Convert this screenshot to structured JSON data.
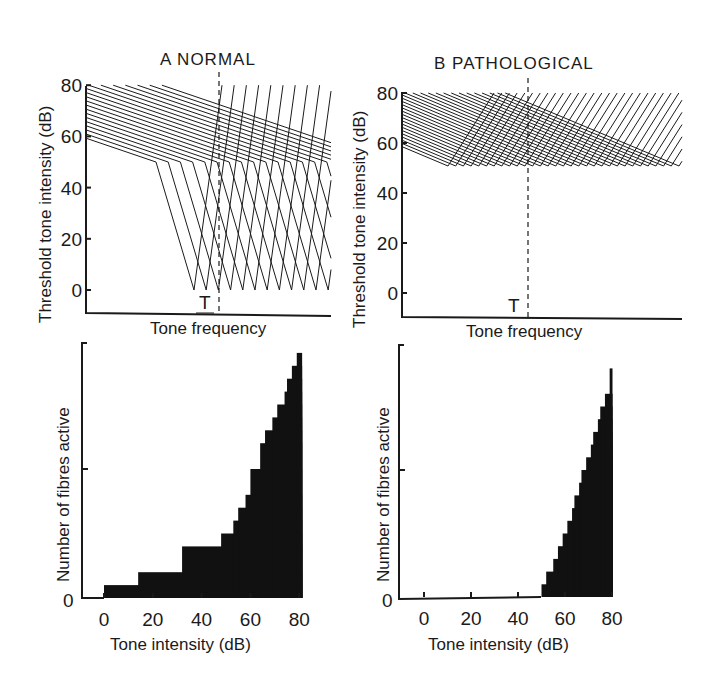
{
  "chart_data": [
    {
      "id": "A-top",
      "type": "line",
      "title": "A  NORMAL",
      "xlabel": "Tone frequency",
      "ylabel": "Threshold tone intensity (dB)",
      "yticks": [
        "0",
        "20",
        "40",
        "60",
        "80"
      ],
      "ylim": [
        -9,
        80
      ],
      "marker_label": "T",
      "description": "Family of V-shaped fibre tuning curves: sharp tips at 0 dB, low-frequency tails with knee near 50 dB",
      "curves": {
        "tip_db": 0,
        "knee_db": 50,
        "max_db": 80,
        "count_visible_tips": 12
      },
      "grid": false
    },
    {
      "id": "B-top",
      "type": "line",
      "title": "B  PATHOLOGICAL",
      "xlabel": "Tone frequency",
      "ylabel": "Threshold tone intensity (dB)",
      "yticks": [
        "0",
        "20",
        "40",
        "60",
        "80"
      ],
      "ylim": [
        -9,
        80
      ],
      "marker_label": "T",
      "description": "Family of broad tuning curves with tips elevated to ~50 dB",
      "curves": {
        "tip_db": 50,
        "max_db": 80,
        "count_visible_tips": 30
      },
      "grid": false
    },
    {
      "id": "A-bottom",
      "type": "bar",
      "xlabel": "Tone intensity (dB)",
      "ylabel": "Number of fibres active",
      "xticks": [
        "0",
        "20",
        "40",
        "60",
        "80"
      ],
      "xlim": [
        -9,
        82
      ],
      "yticks": [
        "0"
      ],
      "ylim": [
        0,
        20
      ],
      "steps": [
        {
          "x": 0,
          "y": 1
        },
        {
          "x": 14,
          "y": 2
        },
        {
          "x": 32,
          "y": 4
        },
        {
          "x": 48,
          "y": 5
        },
        {
          "x": 53,
          "y": 6
        },
        {
          "x": 55,
          "y": 7
        },
        {
          "x": 58,
          "y": 8
        },
        {
          "x": 60,
          "y": 10
        },
        {
          "x": 64,
          "y": 12
        },
        {
          "x": 66,
          "y": 13
        },
        {
          "x": 69,
          "y": 14
        },
        {
          "x": 71,
          "y": 15
        },
        {
          "x": 74,
          "y": 16
        },
        {
          "x": 75,
          "y": 17
        },
        {
          "x": 77,
          "y": 18
        },
        {
          "x": 79,
          "y": 19
        }
      ],
      "x_end": 81
    },
    {
      "id": "B-bottom",
      "type": "bar",
      "xlabel": "Tone intensity (dB)",
      "ylabel": "Number of fibres active",
      "xticks": [
        "0",
        "20",
        "40",
        "60",
        "80"
      ],
      "xlim": [
        -11,
        82
      ],
      "yticks": [
        "0"
      ],
      "ylim": [
        0,
        19
      ],
      "steps": [
        {
          "x": 50,
          "y": 1
        },
        {
          "x": 52,
          "y": 2
        },
        {
          "x": 55,
          "y": 3
        },
        {
          "x": 57,
          "y": 4
        },
        {
          "x": 59,
          "y": 5
        },
        {
          "x": 61,
          "y": 6
        },
        {
          "x": 63,
          "y": 7
        },
        {
          "x": 64,
          "y": 8
        },
        {
          "x": 66,
          "y": 9
        },
        {
          "x": 67,
          "y": 10
        },
        {
          "x": 69,
          "y": 11
        },
        {
          "x": 71,
          "y": 12
        },
        {
          "x": 72,
          "y": 13
        },
        {
          "x": 74,
          "y": 14
        },
        {
          "x": 75,
          "y": 15
        },
        {
          "x": 77,
          "y": 16
        },
        {
          "x": 79,
          "y": 18
        }
      ],
      "x_end": 80
    }
  ]
}
